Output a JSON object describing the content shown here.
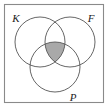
{
  "figure": {
    "type": "venn-diagram",
    "title": "",
    "set_count": 3,
    "frame": {
      "visible": true,
      "stroke_color": "#8a8a8a",
      "background_color": "#ffffff"
    },
    "circle_stroke_color": "#555555",
    "shaded_region": {
      "name": "triple-intersection",
      "description": "K and F and P",
      "fill_color": "#a9a9a9",
      "shaded": true
    },
    "sets": [
      {
        "id": "K",
        "label": "K",
        "position": "top-left",
        "label_x": 16,
        "label_y": 22,
        "cx": 40,
        "cy": 42,
        "r": 25
      },
      {
        "id": "F",
        "label": "F",
        "position": "top-right",
        "label_x": 88,
        "label_y": 22,
        "cx": 70,
        "cy": 42,
        "r": 25
      },
      {
        "id": "P",
        "label": "P",
        "position": "bottom-center",
        "label_x": 72,
        "label_y": 100,
        "cx": 55,
        "cy": 67,
        "r": 25
      }
    ]
  }
}
